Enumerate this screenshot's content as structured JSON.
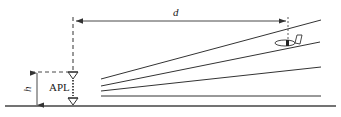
{
  "diagram": {
    "title": "",
    "labels": {
      "distance": "d",
      "height": "h",
      "reference_point": "APL"
    },
    "elements": {
      "ground_line": "ground",
      "glide_lines_count": 4,
      "aircraft": "aircraft-icon"
    },
    "colors": {
      "stroke": "#333333",
      "background": "#ffffff"
    }
  }
}
